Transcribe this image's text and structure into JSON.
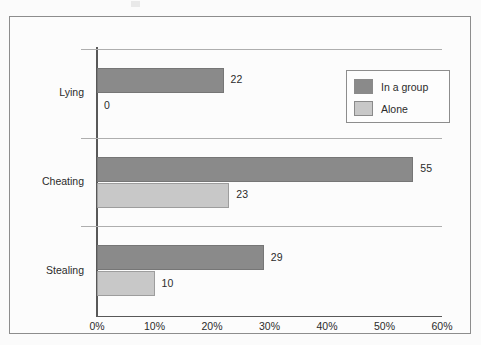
{
  "chart_data": {
    "type": "bar",
    "orientation": "horizontal",
    "title": "",
    "subtitle": "",
    "xlabel": "",
    "ylabel": "",
    "categories": [
      "Lying",
      "Cheating",
      "Stealing"
    ],
    "series": [
      {
        "name": "In a group",
        "values": [
          22,
          55,
          29
        ],
        "color": "#8a8a8a"
      },
      {
        "name": "Alone",
        "values": [
          0,
          23,
          10
        ],
        "color": "#c8c8c8"
      }
    ],
    "value_labels": {
      "Lying": {
        "In a group": "22",
        "Alone": "0"
      },
      "Cheating": {
        "In a group": "55",
        "Alone": "23"
      },
      "Stealing": {
        "In a group": "29",
        "Alone": "10"
      }
    },
    "xlim": [
      0,
      60
    ],
    "xticks": [
      0,
      10,
      20,
      30,
      40,
      50,
      60
    ],
    "xtick_labels": [
      "0%",
      "10%",
      "20%",
      "30%",
      "40%",
      "50%",
      "60%"
    ],
    "grid": "horizontal-category-separators",
    "legend_position": "top-right",
    "data_labels_shown": true
  },
  "axis": {
    "ticks": [
      {
        "label": "0%",
        "value": 0
      },
      {
        "label": "10%",
        "value": 10
      },
      {
        "label": "20%",
        "value": 20
      },
      {
        "label": "30%",
        "value": 30
      },
      {
        "label": "40%",
        "value": 40
      },
      {
        "label": "50%",
        "value": 50
      },
      {
        "label": "60%",
        "value": 60
      }
    ]
  },
  "legend": {
    "items": [
      {
        "label": "In a group",
        "color": "#8a8a8a"
      },
      {
        "label": "Alone",
        "color": "#c8c8c8"
      }
    ]
  },
  "colors": {
    "series_group": "#8a8a8a",
    "series_alone": "#c8c8c8",
    "axis": "#585858",
    "gridline": "#aeaeae",
    "frame_border": "#8d8d8d",
    "text": "#2b2b2b",
    "background": "#fbfbfb"
  }
}
